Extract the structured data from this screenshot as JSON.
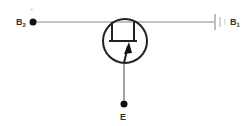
{
  "diagram": {
    "type": "unijunction transistor schematic",
    "terminals": {
      "b2": {
        "label": "B",
        "subscript": "2",
        "polarity": "+"
      },
      "b1": {
        "label": "B",
        "subscript": "1"
      },
      "e": {
        "label": "E"
      }
    },
    "colors": {
      "wire": "#888888",
      "symbol": "#222222",
      "label": "#333333",
      "battery": "#aaaaaa"
    }
  }
}
